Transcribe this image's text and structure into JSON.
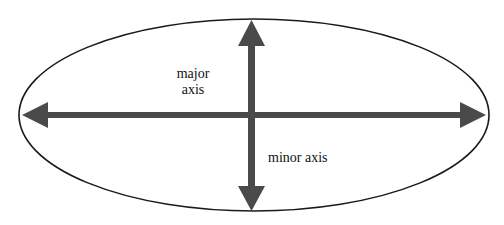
{
  "diagram": {
    "type": "ellipse-axes",
    "labels": {
      "major_line1": "major",
      "major_line2": "axis",
      "minor": "minor axis"
    },
    "ellipse": {
      "cx": 254,
      "cy": 115,
      "rx": 236,
      "ry": 96
    },
    "colors": {
      "outline": "#1a1a1a",
      "arrow": "#4a4a4a",
      "background": "#ffffff"
    }
  }
}
